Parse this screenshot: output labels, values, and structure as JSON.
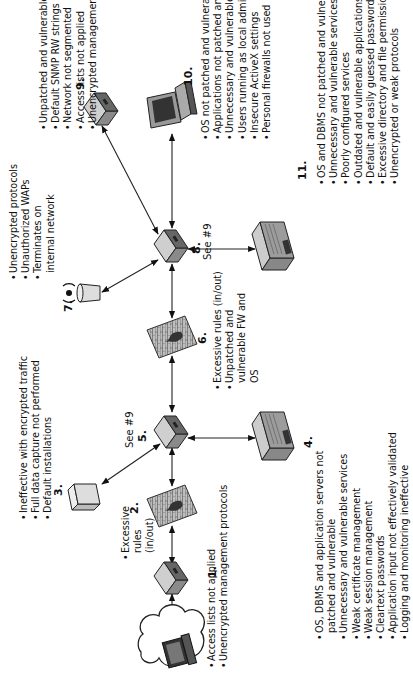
{
  "diagram": {
    "orientation": "rotated -90deg",
    "nodes": [
      {
        "id": "0",
        "type": "internet-cloud-with-laptop",
        "label": ""
      },
      {
        "id": "1",
        "label": "1.",
        "type": "router",
        "notes": [
          "Access lists not applied",
          "Unencrypted management protocols"
        ]
      },
      {
        "id": "2",
        "label": "2.",
        "type": "firewall",
        "notes": [
          "Excessive rules (in/out)"
        ]
      },
      {
        "id": "3",
        "label": "3.",
        "type": "ids-sensor",
        "notes": [
          "Ineffective with encrypted traffic",
          "Full data capture not performed",
          "Default installations"
        ]
      },
      {
        "id": "4",
        "label": "4.",
        "type": "server",
        "notes": [
          "OS, DBMS and application servers not patched and vulnerable",
          "Unnecessary and vulnerable services",
          "Weak certificate management",
          "Weak session management",
          "Cleartext passwords",
          "Application input not effectively validated",
          "Logging and monitoring ineffective"
        ]
      },
      {
        "id": "5",
        "label": "5.",
        "type": "switch",
        "see": "See #9"
      },
      {
        "id": "6",
        "label": "6.",
        "type": "firewall",
        "notes": [
          "Excessive rules (in/out)",
          "Unpatched and vulnerable FW and OS"
        ]
      },
      {
        "id": "7",
        "label": "7.",
        "type": "wireless-access-point",
        "notes": [
          "Unencrypted protocols",
          "Unauthorized WAPs",
          "Terminates on internal network"
        ]
      },
      {
        "id": "8",
        "label": "8.",
        "type": "switch",
        "see": "See #9"
      },
      {
        "id": "9",
        "label": "9.",
        "type": "router",
        "notes": [
          "Unpatched and vulnerable services",
          "Default SNMP RW strings",
          "Network not segmented",
          "Access lists not applied",
          "Unencrypted management protocols"
        ]
      },
      {
        "id": "10",
        "label": "10.",
        "type": "workstation",
        "notes": [
          "OS not patched and vulnerable",
          "Applications not patched and vulnerable",
          "Unnecessary and vulnerable services",
          "Users running as local admin",
          "Insecure ActiveX settings",
          "Personal firewalls not used"
        ]
      },
      {
        "id": "11",
        "label": "11.",
        "type": "server",
        "notes": [
          "OS and DBMS not patched and vulnerable",
          "Unnecessary and vulnerable services",
          "Poorly configured services",
          "Outdated and vulnerable applications",
          "Default and easily guessed passwords",
          "Excessive directory and file permissions",
          "Unencrypted or weak protocols"
        ]
      }
    ],
    "edges": [
      [
        "0",
        "1"
      ],
      [
        "1",
        "2"
      ],
      [
        "2",
        "5"
      ],
      [
        "5",
        "3"
      ],
      [
        "5",
        "4"
      ],
      [
        "5",
        "6"
      ],
      [
        "6",
        "8"
      ],
      [
        "8",
        "7"
      ],
      [
        "8",
        "9"
      ],
      [
        "8",
        "10"
      ],
      [
        "8",
        "11"
      ]
    ],
    "colors": {
      "device_fill": "#9a9a9a",
      "device_dark": "#555555",
      "line": "#222222",
      "background": "#ffffff"
    }
  }
}
